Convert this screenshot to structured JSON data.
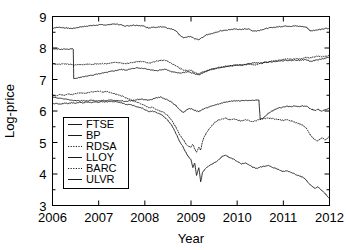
{
  "figure": {
    "background": "#ffffff",
    "foreground": "#000000",
    "width": 346,
    "height": 250
  },
  "chart_data": {
    "type": "line",
    "title": "",
    "xlabel": "Year",
    "ylabel": "Log-price",
    "xlim": [
      2006.0,
      2012.0
    ],
    "ylim": [
      3,
      9
    ],
    "xticks": [
      2006,
      2007,
      2008,
      2009,
      2010,
      2011,
      2012
    ],
    "xticklabels": [
      "2006",
      "2007",
      "2008",
      "2009",
      "2010",
      "2011",
      "2012"
    ],
    "yticks": [
      3,
      4,
      5,
      6,
      7,
      8,
      9
    ],
    "yticklabels": [
      "3",
      "4",
      "5",
      "6",
      "7",
      "8",
      "9"
    ],
    "grid": false,
    "legend_position": "center-left",
    "legend_entries": [
      "FTSE",
      "BP",
      "RDSA",
      "LLOY",
      "BARC",
      "ULVR"
    ],
    "series": [
      {
        "name": "FTSE",
        "style": "solid",
        "color": "#000000",
        "x": [
          2006.0,
          2006.08,
          2006.17,
          2006.25,
          2006.33,
          2006.42,
          2006.5,
          2006.58,
          2006.67,
          2006.75,
          2006.83,
          2006.92,
          2007.0,
          2007.08,
          2007.17,
          2007.25,
          2007.33,
          2007.42,
          2007.5,
          2007.58,
          2007.67,
          2007.75,
          2007.83,
          2007.92,
          2008.0,
          2008.08,
          2008.17,
          2008.25,
          2008.33,
          2008.42,
          2008.5,
          2008.58,
          2008.67,
          2008.75,
          2008.83,
          2008.92,
          2009.0,
          2009.08,
          2009.17,
          2009.25,
          2009.33,
          2009.42,
          2009.5,
          2009.58,
          2009.67,
          2009.75,
          2009.83,
          2009.92,
          2010.0,
          2010.08,
          2010.17,
          2010.25,
          2010.33,
          2010.42,
          2010.5,
          2010.58,
          2010.67,
          2010.75,
          2010.83,
          2010.92,
          2011.0,
          2011.08,
          2011.17,
          2011.25,
          2011.33,
          2011.42,
          2011.5,
          2011.58,
          2011.67,
          2011.75,
          2011.83,
          2011.92,
          2012.0
        ],
        "y": [
          8.63,
          8.65,
          8.66,
          8.64,
          8.63,
          8.62,
          8.64,
          8.66,
          8.68,
          8.7,
          8.71,
          8.72,
          8.73,
          8.74,
          8.73,
          8.75,
          8.76,
          8.75,
          8.73,
          8.7,
          8.71,
          8.73,
          8.72,
          8.71,
          8.68,
          8.64,
          8.66,
          8.65,
          8.67,
          8.66,
          8.62,
          8.6,
          8.55,
          8.42,
          8.33,
          8.35,
          8.36,
          8.3,
          8.27,
          8.34,
          8.42,
          8.45,
          8.47,
          8.52,
          8.55,
          8.56,
          8.58,
          8.6,
          8.6,
          8.58,
          8.61,
          8.6,
          8.55,
          8.54,
          8.57,
          8.6,
          8.63,
          8.65,
          8.66,
          8.68,
          8.69,
          8.7,
          8.69,
          8.7,
          8.69,
          8.68,
          8.66,
          8.55,
          8.56,
          8.58,
          8.59,
          8.62,
          8.61
        ]
      },
      {
        "name": "BP",
        "style": "solid",
        "color": "#000000",
        "x": [
          2006.0,
          2006.08,
          2006.17,
          2006.25,
          2006.33,
          2006.42,
          2006.45,
          2006.46,
          2006.5,
          2006.58,
          2006.67,
          2006.75,
          2006.83,
          2006.92,
          2007.0,
          2007.08,
          2007.17,
          2007.25,
          2007.33,
          2007.42,
          2007.5,
          2007.58,
          2007.67,
          2007.75,
          2007.83,
          2007.92,
          2008.0,
          2008.08,
          2008.17,
          2008.25,
          2008.33,
          2008.42,
          2008.5,
          2008.58,
          2008.67,
          2008.75,
          2008.83,
          2008.92,
          2009.0,
          2009.08,
          2009.17,
          2009.25,
          2009.33,
          2009.42,
          2009.5,
          2009.58,
          2009.67,
          2009.75,
          2009.83,
          2009.92,
          2010.0,
          2010.08,
          2010.17,
          2010.25,
          2010.33,
          2010.42,
          2010.5,
          2010.58,
          2010.67,
          2010.75,
          2010.83,
          2010.92,
          2011.0,
          2011.08,
          2011.17,
          2011.25,
          2011.33,
          2011.42,
          2011.5,
          2011.58,
          2011.67,
          2011.75,
          2011.83,
          2011.92,
          2012.0
        ],
        "y": [
          7.97,
          7.97,
          7.96,
          7.97,
          7.96,
          7.97,
          7.96,
          7.03,
          7.03,
          7.06,
          7.09,
          7.11,
          7.13,
          7.16,
          7.18,
          7.2,
          7.22,
          7.25,
          7.27,
          7.3,
          7.32,
          7.3,
          7.32,
          7.35,
          7.37,
          7.36,
          7.35,
          7.32,
          7.3,
          7.28,
          7.3,
          7.32,
          7.3,
          7.25,
          7.22,
          7.2,
          7.22,
          7.24,
          7.22,
          7.18,
          7.15,
          7.2,
          7.25,
          7.3,
          7.33,
          7.36,
          7.38,
          7.4,
          7.42,
          7.44,
          7.45,
          7.47,
          7.48,
          7.5,
          7.52,
          7.53,
          7.52,
          7.54,
          7.55,
          7.56,
          7.58,
          7.59,
          7.6,
          7.61,
          7.6,
          7.62,
          7.61,
          7.62,
          7.63,
          7.58,
          7.6,
          7.63,
          7.65,
          7.68,
          7.7
        ]
      },
      {
        "name": "RDSA",
        "style": "dotted",
        "color": "#000000",
        "x": [
          2006.0,
          2006.08,
          2006.17,
          2006.25,
          2006.33,
          2006.42,
          2006.5,
          2006.58,
          2006.67,
          2006.75,
          2006.83,
          2006.92,
          2007.0,
          2007.08,
          2007.17,
          2007.25,
          2007.33,
          2007.42,
          2007.5,
          2007.58,
          2007.67,
          2007.75,
          2007.83,
          2007.92,
          2008.0,
          2008.08,
          2008.17,
          2008.25,
          2008.33,
          2008.42,
          2008.5,
          2008.58,
          2008.67,
          2008.75,
          2008.83,
          2008.92,
          2009.0,
          2009.08,
          2009.17,
          2009.25,
          2009.33,
          2009.42,
          2009.5,
          2009.58,
          2009.67,
          2009.75,
          2009.83,
          2009.92,
          2010.0,
          2010.08,
          2010.17,
          2010.25,
          2010.33,
          2010.42,
          2010.5,
          2010.58,
          2010.67,
          2010.75,
          2010.83,
          2010.92,
          2011.0,
          2011.08,
          2011.17,
          2011.25,
          2011.33,
          2011.42,
          2011.5,
          2011.58,
          2011.67,
          2011.75,
          2011.83,
          2011.92,
          2012.0
        ],
        "y": [
          7.5,
          7.49,
          7.48,
          7.5,
          7.49,
          7.47,
          7.46,
          7.48,
          7.47,
          7.49,
          7.48,
          7.5,
          7.49,
          7.51,
          7.5,
          7.52,
          7.54,
          7.53,
          7.52,
          7.5,
          7.52,
          7.55,
          7.57,
          7.58,
          7.55,
          7.52,
          7.55,
          7.58,
          7.6,
          7.62,
          7.58,
          7.5,
          7.44,
          7.36,
          7.3,
          7.28,
          7.3,
          7.22,
          7.18,
          7.24,
          7.28,
          7.32,
          7.35,
          7.38,
          7.4,
          7.42,
          7.44,
          7.45,
          7.46,
          7.44,
          7.47,
          7.48,
          7.46,
          7.47,
          7.5,
          7.53,
          7.56,
          7.58,
          7.6,
          7.62,
          7.63,
          7.65,
          7.64,
          7.66,
          7.65,
          7.67,
          7.7,
          7.68,
          7.72,
          7.74,
          7.72,
          7.74,
          7.76
        ]
      },
      {
        "name": "LLOY",
        "style": "solid",
        "color": "#000000",
        "x": [
          2006.0,
          2006.08,
          2006.17,
          2006.25,
          2006.33,
          2006.42,
          2006.5,
          2006.58,
          2006.67,
          2006.75,
          2006.83,
          2006.92,
          2007.0,
          2007.08,
          2007.17,
          2007.25,
          2007.33,
          2007.42,
          2007.5,
          2007.58,
          2007.67,
          2007.75,
          2007.83,
          2007.92,
          2008.0,
          2008.08,
          2008.17,
          2008.25,
          2008.33,
          2008.42,
          2008.5,
          2008.58,
          2008.67,
          2008.75,
          2008.83,
          2008.92,
          2009.0,
          2009.04,
          2009.08,
          2009.12,
          2009.17,
          2009.21,
          2009.25,
          2009.33,
          2009.42,
          2009.5,
          2009.58,
          2009.67,
          2009.75,
          2009.83,
          2009.92,
          2010.0,
          2010.08,
          2010.17,
          2010.25,
          2010.33,
          2010.42,
          2010.5,
          2010.58,
          2010.67,
          2010.75,
          2010.83,
          2010.92,
          2011.0,
          2011.08,
          2011.17,
          2011.25,
          2011.33,
          2011.42,
          2011.5,
          2011.58,
          2011.67,
          2011.75,
          2011.83,
          2011.92,
          2012.0
        ],
        "y": [
          6.22,
          6.24,
          6.22,
          6.25,
          6.24,
          6.26,
          6.25,
          6.27,
          6.26,
          6.28,
          6.27,
          6.29,
          6.28,
          6.3,
          6.29,
          6.31,
          6.3,
          6.28,
          6.26,
          6.22,
          6.2,
          6.18,
          6.14,
          6.1,
          6.05,
          5.98,
          6.0,
          5.95,
          5.9,
          5.82,
          5.7,
          5.55,
          5.3,
          5.05,
          4.85,
          4.6,
          4.45,
          4.2,
          4.35,
          3.95,
          4.2,
          3.75,
          4.05,
          4.2,
          4.28,
          4.35,
          4.42,
          4.55,
          4.6,
          4.52,
          4.48,
          4.4,
          4.32,
          4.35,
          4.3,
          4.22,
          4.18,
          4.22,
          4.25,
          4.28,
          4.22,
          4.18,
          4.12,
          4.08,
          4.1,
          4.05,
          4.0,
          3.95,
          3.9,
          3.8,
          3.65,
          3.55,
          3.58,
          3.48,
          3.35,
          3.22
        ]
      },
      {
        "name": "BARC",
        "style": "dotted",
        "color": "#000000",
        "x": [
          2006.0,
          2006.08,
          2006.17,
          2006.25,
          2006.33,
          2006.42,
          2006.5,
          2006.58,
          2006.67,
          2006.75,
          2006.83,
          2006.92,
          2007.0,
          2007.08,
          2007.17,
          2007.25,
          2007.33,
          2007.42,
          2007.5,
          2007.58,
          2007.67,
          2007.75,
          2007.83,
          2007.92,
          2008.0,
          2008.08,
          2008.17,
          2008.25,
          2008.33,
          2008.42,
          2008.5,
          2008.58,
          2008.67,
          2008.75,
          2008.83,
          2008.92,
          2009.0,
          2009.04,
          2009.08,
          2009.12,
          2009.17,
          2009.21,
          2009.25,
          2009.33,
          2009.42,
          2009.5,
          2009.58,
          2009.67,
          2009.75,
          2009.83,
          2009.92,
          2010.0,
          2010.08,
          2010.17,
          2010.25,
          2010.33,
          2010.42,
          2010.5,
          2010.58,
          2010.67,
          2010.75,
          2010.83,
          2010.92,
          2011.0,
          2011.08,
          2011.17,
          2011.25,
          2011.33,
          2011.42,
          2011.5,
          2011.58,
          2011.67,
          2011.75,
          2011.83,
          2011.92,
          2012.0
        ],
        "y": [
          6.5,
          6.48,
          6.52,
          6.5,
          6.54,
          6.52,
          6.55,
          6.57,
          6.56,
          6.58,
          6.6,
          6.62,
          6.63,
          6.6,
          6.62,
          6.58,
          6.55,
          6.52,
          6.48,
          6.42,
          6.38,
          6.32,
          6.28,
          6.22,
          6.18,
          6.1,
          6.12,
          6.05,
          6.0,
          5.95,
          5.85,
          5.7,
          5.5,
          5.25,
          5.1,
          4.9,
          4.85,
          4.95,
          4.8,
          4.7,
          4.85,
          4.75,
          5.05,
          5.3,
          5.48,
          5.62,
          5.7,
          5.75,
          5.78,
          5.72,
          5.75,
          5.72,
          5.68,
          5.72,
          5.7,
          5.66,
          5.7,
          5.74,
          5.76,
          5.78,
          5.76,
          5.74,
          5.72,
          5.7,
          5.72,
          5.68,
          5.64,
          5.6,
          5.55,
          5.45,
          5.25,
          5.1,
          5.05,
          5.15,
          5.08,
          5.2
        ]
      },
      {
        "name": "ULVR",
        "style": "solid",
        "color": "#000000",
        "x": [
          2006.0,
          2006.08,
          2006.17,
          2006.25,
          2006.33,
          2006.42,
          2006.5,
          2006.58,
          2006.67,
          2006.75,
          2006.83,
          2006.92,
          2007.0,
          2007.08,
          2007.17,
          2007.25,
          2007.33,
          2007.42,
          2007.5,
          2007.58,
          2007.67,
          2007.75,
          2007.83,
          2007.92,
          2008.0,
          2008.08,
          2008.17,
          2008.25,
          2008.33,
          2008.42,
          2008.5,
          2008.58,
          2008.67,
          2008.75,
          2008.83,
          2008.92,
          2009.0,
          2009.08,
          2009.17,
          2009.25,
          2009.33,
          2009.42,
          2009.5,
          2009.58,
          2009.67,
          2009.75,
          2009.83,
          2009.92,
          2010.0,
          2010.08,
          2010.17,
          2010.25,
          2010.33,
          2010.42,
          2010.47,
          2010.5,
          2010.58,
          2010.67,
          2010.75,
          2010.83,
          2010.92,
          2011.0,
          2011.08,
          2011.17,
          2011.25,
          2011.33,
          2011.42,
          2011.5,
          2011.58,
          2011.67,
          2011.75,
          2011.83,
          2011.92,
          2012.0
        ],
        "y": [
          6.45,
          6.42,
          6.4,
          6.38,
          6.36,
          6.34,
          6.33,
          6.32,
          6.33,
          6.32,
          6.34,
          6.33,
          6.32,
          6.34,
          6.33,
          6.35,
          6.34,
          6.33,
          6.32,
          6.3,
          6.32,
          6.34,
          6.36,
          6.38,
          6.36,
          6.34,
          6.38,
          6.42,
          6.44,
          6.4,
          6.35,
          6.28,
          6.18,
          6.05,
          5.95,
          6.05,
          6.08,
          6.02,
          5.98,
          6.05,
          6.1,
          6.14,
          6.18,
          6.22,
          6.25,
          6.28,
          6.3,
          6.32,
          6.33,
          6.32,
          6.34,
          6.33,
          6.34,
          6.35,
          6.35,
          5.72,
          5.8,
          5.92,
          6.0,
          6.05,
          6.1,
          6.12,
          6.15,
          6.13,
          6.16,
          6.14,
          6.16,
          6.15,
          6.08,
          6.02,
          6.05,
          6.0,
          6.05,
          6.08
        ]
      }
    ]
  }
}
